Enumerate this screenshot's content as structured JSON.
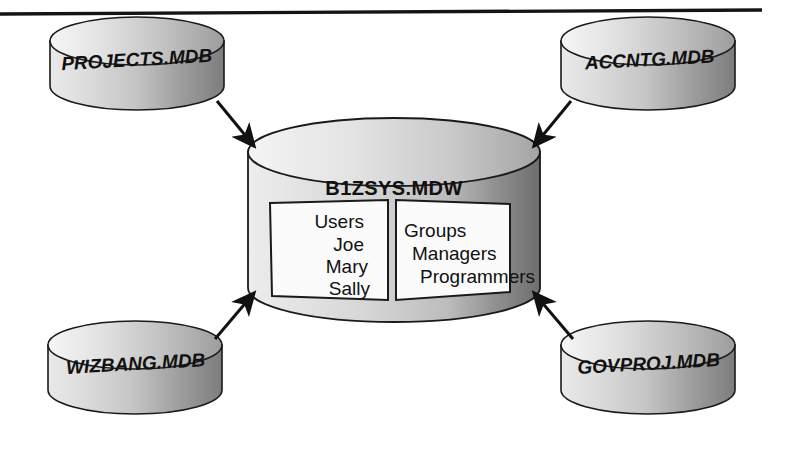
{
  "figure": {
    "title_rule": "top-horizontal-rule",
    "central_database": {
      "label": "B1ZSYS.MDW",
      "panels": [
        {
          "name": "users-panel",
          "lines": [
            "Users",
            "Joe",
            "Mary",
            "Sally"
          ]
        },
        {
          "name": "groups-panel",
          "lines": [
            "Groups",
            "Managers",
            "Programmers"
          ]
        }
      ]
    },
    "databases": [
      {
        "id": "projects",
        "label": "PROJECTS.MDB",
        "position": "top-left"
      },
      {
        "id": "accntg",
        "label": "ACCNTG.MDB",
        "position": "top-right"
      },
      {
        "id": "wizbang",
        "label": "WIZBANG.MDB",
        "position": "bottom-left"
      },
      {
        "id": "govproj",
        "label": "GOVPROJ.MDB",
        "position": "bottom-right"
      }
    ],
    "arrows": [
      {
        "from": "projects",
        "to": "central",
        "direction": "down-right"
      },
      {
        "from": "accntg",
        "to": "central",
        "direction": "down-left"
      },
      {
        "from": "wizbang",
        "to": "central",
        "direction": "up-right"
      },
      {
        "from": "govproj",
        "to": "central",
        "direction": "up-left"
      }
    ],
    "colors": {
      "ink": "#111111",
      "rule": "#141414",
      "cylinder_light": "#f2f2f2",
      "cylinder_mid": "#c9c9c9",
      "cylinder_dark": "#6e6e6e",
      "panel_fill": "#fbfbfb",
      "background": "#ffffff"
    }
  }
}
